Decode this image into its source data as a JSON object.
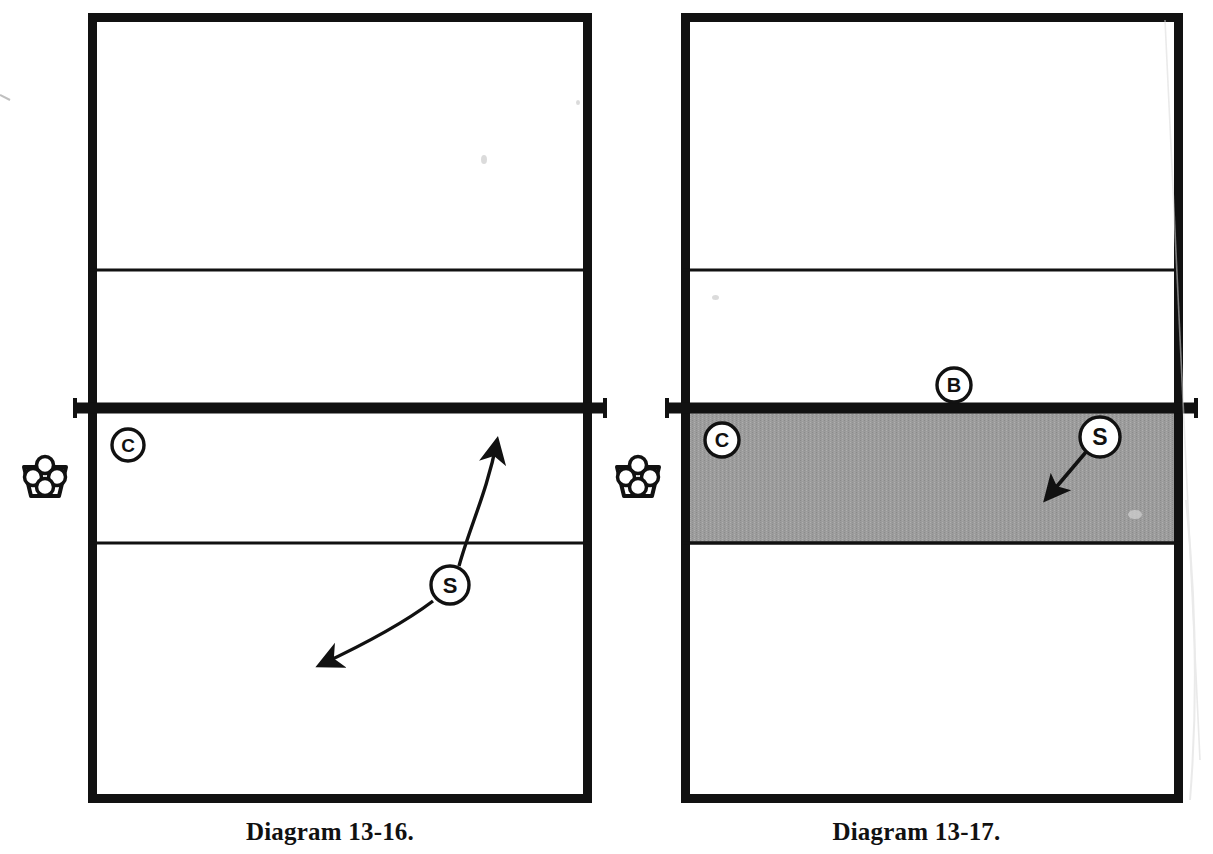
{
  "page": {
    "background_color": "#ffffff",
    "ink_color": "#111111",
    "shade_color": "#9c9c9c",
    "width": 1213,
    "height": 854
  },
  "diagrams": [
    {
      "id": "diagram-13-16",
      "caption": "Diagram 13-16.",
      "court": {
        "left": 88,
        "top": 13,
        "right": 592,
        "bottom": 803,
        "border_width": 9,
        "net_y": 408,
        "net_width": 11,
        "net_overhang": 13,
        "attack_line_top_y": 270,
        "attack_line_bottom_y": 543,
        "attack_line_width": 3,
        "shaded_zone": false
      },
      "markers": [
        {
          "name": "coach",
          "label": "C",
          "x": 128,
          "y": 445,
          "r": 16
        },
        {
          "name": "setter",
          "label": "S",
          "x": 450,
          "y": 585,
          "r": 19
        }
      ],
      "ball_cart": {
        "name": "ball-cart",
        "x": 45,
        "y": 477,
        "w": 46,
        "h": 42
      },
      "arrows": [
        {
          "name": "setter-movement-arrow-up",
          "style": "curved",
          "path": "M 457 567 C 470 525 487 495 497 438",
          "arrowhead_at": "end"
        },
        {
          "name": "setter-movement-arrow-down",
          "style": "curved",
          "path": "M 434 600 C 404 622 368 643 322 665",
          "arrowhead_at": "end"
        }
      ]
    },
    {
      "id": "diagram-13-17",
      "caption": "Diagram 13-17.",
      "court": {
        "left": 681,
        "top": 13,
        "right": 1183,
        "bottom": 803,
        "border_width": 9,
        "net_y": 408,
        "net_width": 11,
        "net_overhang": 13,
        "attack_line_top_y": 270,
        "attack_line_bottom_y": 543,
        "attack_line_width": 3,
        "shaded_zone": true,
        "shaded_zone_top_y": 412,
        "shaded_zone_bottom_y": 543
      },
      "markers": [
        {
          "name": "blocker",
          "label": "B",
          "x": 954,
          "y": 385,
          "r": 17
        },
        {
          "name": "coach",
          "label": "C",
          "x": 722,
          "y": 440,
          "r": 17
        },
        {
          "name": "setter",
          "label": "S",
          "x": 1100,
          "y": 437,
          "r": 20
        }
      ],
      "ball_cart": {
        "name": "ball-cart",
        "x": 638,
        "y": 477,
        "w": 46,
        "h": 42
      },
      "arrows": [
        {
          "name": "setter-movement-arrow-down-left",
          "style": "straight",
          "path": "M 1085 452 L 1048 497",
          "arrowhead_at": "end"
        }
      ]
    }
  ],
  "legend_semantics": {
    "C": "coach",
    "S": "setter",
    "B": "blocker"
  }
}
